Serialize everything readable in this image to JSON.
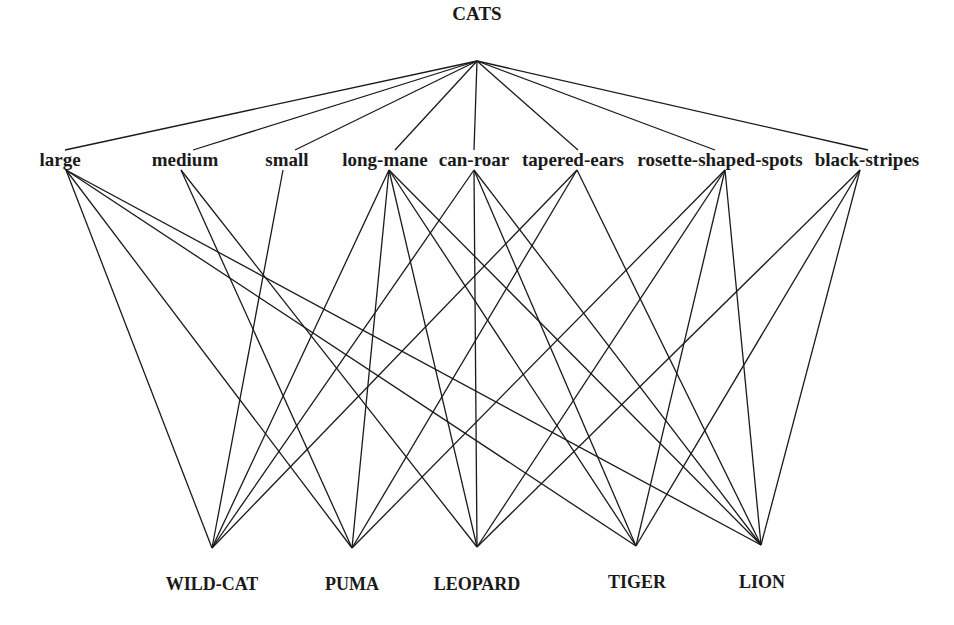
{
  "diagram": {
    "type": "lattice",
    "root": {
      "id": "cats",
      "label": "CATS",
      "x": 477,
      "y": 20,
      "anchor_y": 61
    },
    "attributes": [
      {
        "id": "large",
        "label": "large",
        "x": 60,
        "y": 166,
        "anchor_top_y": 150,
        "anchor_x_top": 65,
        "anchor_x_bottom": 66
      },
      {
        "id": "medium",
        "label": "medium",
        "x": 185,
        "y": 166,
        "anchor_top_y": 150,
        "anchor_x_top": 193,
        "anchor_x_bottom": 181
      },
      {
        "id": "small",
        "label": "small",
        "x": 287,
        "y": 166,
        "anchor_top_y": 150,
        "anchor_x_top": 295,
        "anchor_x_bottom": 283
      },
      {
        "id": "long-mane",
        "label": "long-mane",
        "x": 385,
        "y": 166,
        "anchor_top_y": 150,
        "anchor_x_top": 395,
        "anchor_x_bottom": 389
      },
      {
        "id": "can-roar",
        "label": "can-roar",
        "x": 474,
        "y": 166,
        "anchor_top_y": 150,
        "anchor_x_top": 474,
        "anchor_x_bottom": 474
      },
      {
        "id": "tapered-ears",
        "label": "tapered-ears",
        "x": 573,
        "y": 166,
        "anchor_top_y": 150,
        "anchor_x_top": 578,
        "anchor_x_bottom": 577
      },
      {
        "id": "rosette-shaped-spots",
        "label": "rosette-shaped-spots",
        "x": 720,
        "y": 166,
        "anchor_top_y": 150,
        "anchor_x_top": 715,
        "anchor_x_bottom": 725
      },
      {
        "id": "black-stripes",
        "label": "black-stripes",
        "x": 867,
        "y": 166,
        "anchor_top_y": 150,
        "anchor_x_top": 868,
        "anchor_x_bottom": 860
      }
    ],
    "leaves": [
      {
        "id": "wild-cat",
        "label": "WILD-CAT",
        "x": 212,
        "y": 590,
        "anchor_x": 212,
        "anchor_y": 548
      },
      {
        "id": "puma",
        "label": "PUMA",
        "x": 352,
        "y": 590,
        "anchor_x": 352,
        "anchor_y": 548
      },
      {
        "id": "leopard",
        "label": "LEOPARD",
        "x": 477,
        "y": 590,
        "anchor_x": 477,
        "anchor_y": 547
      },
      {
        "id": "tiger",
        "label": "TIGER",
        "x": 637,
        "y": 588,
        "anchor_x": 636,
        "anchor_y": 546
      },
      {
        "id": "lion",
        "label": "LION",
        "x": 762,
        "y": 588,
        "anchor_x": 761,
        "anchor_y": 545
      }
    ],
    "edges": [
      [
        "large",
        "wild-cat"
      ],
      [
        "large",
        "puma"
      ],
      [
        "large",
        "tiger"
      ],
      [
        "large",
        "lion"
      ],
      [
        "medium",
        "puma"
      ],
      [
        "medium",
        "leopard"
      ],
      [
        "small",
        "wild-cat"
      ],
      [
        "long-mane",
        "wild-cat"
      ],
      [
        "long-mane",
        "puma"
      ],
      [
        "long-mane",
        "leopard"
      ],
      [
        "long-mane",
        "tiger"
      ],
      [
        "long-mane",
        "lion"
      ],
      [
        "can-roar",
        "wild-cat"
      ],
      [
        "can-roar",
        "leopard"
      ],
      [
        "can-roar",
        "tiger"
      ],
      [
        "can-roar",
        "lion"
      ],
      [
        "tapered-ears",
        "wild-cat"
      ],
      [
        "tapered-ears",
        "puma"
      ],
      [
        "tapered-ears",
        "lion"
      ],
      [
        "rosette-shaped-spots",
        "puma"
      ],
      [
        "rosette-shaped-spots",
        "leopard"
      ],
      [
        "rosette-shaped-spots",
        "tiger"
      ],
      [
        "rosette-shaped-spots",
        "lion"
      ],
      [
        "black-stripes",
        "leopard"
      ],
      [
        "black-stripes",
        "tiger"
      ],
      [
        "black-stripes",
        "lion"
      ]
    ],
    "colors": {
      "line": "#1a1a1a",
      "text": "#1a1a1a",
      "background": "#ffffff"
    }
  }
}
